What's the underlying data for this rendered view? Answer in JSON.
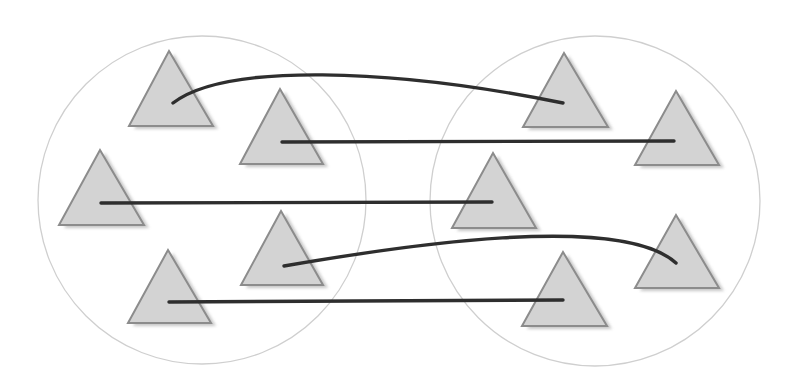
{
  "canvas": {
    "width": 788,
    "height": 392,
    "background": "#ffffff"
  },
  "colors": {
    "circle_stroke": "#cfcfcf",
    "triangle_fill": "#d3d3d3",
    "triangle_stroke": "#8c8c8c",
    "triangle_shadow": "#bdbdbd",
    "link_stroke": "#2e2e2e"
  },
  "groups": [
    {
      "id": "left-group",
      "circle": {
        "cx": 202,
        "cy": 200,
        "r": 164
      },
      "nodes": [
        {
          "id": "L1",
          "apex": [
            169,
            51
          ],
          "base_left": [
            129,
            126
          ],
          "base_right": [
            213,
            126
          ]
        },
        {
          "id": "L2",
          "apex": [
            280,
            89
          ],
          "base_left": [
            240,
            164
          ],
          "base_right": [
            323,
            164
          ]
        },
        {
          "id": "L3",
          "apex": [
            100,
            150
          ],
          "base_left": [
            59,
            225
          ],
          "base_right": [
            144,
            225
          ]
        },
        {
          "id": "L4",
          "apex": [
            281,
            211
          ],
          "base_left": [
            241,
            285
          ],
          "base_right": [
            323,
            285
          ]
        },
        {
          "id": "L5",
          "apex": [
            168,
            250
          ],
          "base_left": [
            128,
            323
          ],
          "base_right": [
            211,
            323
          ]
        }
      ]
    },
    {
      "id": "right-group",
      "circle": {
        "cx": 595,
        "cy": 201,
        "r": 165
      },
      "nodes": [
        {
          "id": "R1",
          "apex": [
            564,
            53
          ],
          "base_left": [
            523,
            127
          ],
          "base_right": [
            608,
            127
          ]
        },
        {
          "id": "R2",
          "apex": [
            676,
            91
          ],
          "base_left": [
            635,
            165
          ],
          "base_right": [
            719,
            165
          ]
        },
        {
          "id": "R3",
          "apex": [
            493,
            153
          ],
          "base_left": [
            452,
            228
          ],
          "base_right": [
            536,
            228
          ]
        },
        {
          "id": "R4",
          "apex": [
            676,
            215
          ],
          "base_left": [
            635,
            288
          ],
          "base_right": [
            719,
            288
          ]
        },
        {
          "id": "R5",
          "apex": [
            563,
            252
          ],
          "base_left": [
            522,
            326
          ],
          "base_right": [
            607,
            326
          ]
        }
      ]
    }
  ],
  "links": [
    {
      "from": "L1",
      "to": "R1",
      "shape": "curve",
      "path": "M173,103 C225,63 390,68 563,103"
    },
    {
      "from": "L2",
      "to": "R2",
      "shape": "straight",
      "path": "M282,142 L674,141"
    },
    {
      "from": "L3",
      "to": "R3",
      "shape": "straight",
      "path": "M101,203 L492,202"
    },
    {
      "from": "L4",
      "to": "R4",
      "shape": "curve",
      "path": "M284,266 C400,246 620,212 676,263"
    },
    {
      "from": "L5",
      "to": "R5",
      "shape": "straight",
      "path": "M169,302 L563,300"
    }
  ]
}
